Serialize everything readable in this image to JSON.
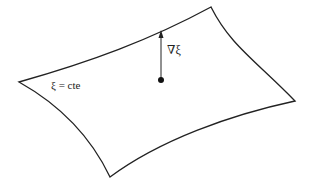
{
  "diagram": {
    "surface_label": "ξ = cte",
    "gradient_label": "∇ξ",
    "colors": {
      "stroke": "#222222",
      "background": "#ffffff",
      "text": "#222222"
    },
    "surface_corners": {
      "left": [
        19,
        82
      ],
      "top_right": [
        211,
        7
      ],
      "right": [
        295,
        101
      ],
      "bottom": [
        110,
        177
      ]
    },
    "gradient_vector": {
      "origin": [
        161,
        80
      ],
      "tip": [
        161,
        31
      ]
    }
  }
}
